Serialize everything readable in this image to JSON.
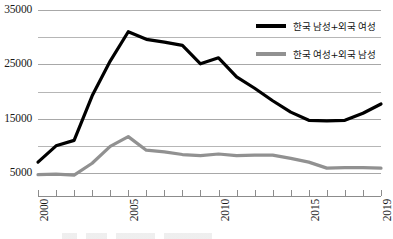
{
  "chart_data": {
    "type": "line",
    "title": "",
    "subtitle": "",
    "xlabel": "",
    "ylabel": "",
    "x": [
      2000,
      2001,
      2002,
      2003,
      2004,
      2005,
      2006,
      2007,
      2008,
      2009,
      2010,
      2011,
      2012,
      2013,
      2014,
      2015,
      2016,
      2017,
      2018,
      2019
    ],
    "categories": [
      "2000",
      "2001",
      "2002",
      "2003",
      "2004",
      "2005",
      "2006",
      "2007",
      "2008",
      "2009",
      "2010",
      "2011",
      "2012",
      "2013",
      "2014",
      "2015",
      "2016",
      "2017",
      "2018",
      "2019"
    ],
    "xlim": [
      2000,
      2019
    ],
    "ylim": [
      0,
      35000
    ],
    "yticks": [
      35000,
      30000,
      25000,
      20000,
      15000,
      10000,
      5000
    ],
    "ytick_labels_shown": [
      "35000",
      "25000",
      "15000",
      "5000"
    ],
    "xtick_labels_shown": [
      "2000",
      "2005",
      "2010",
      "2015",
      "2019"
    ],
    "grid": true,
    "grid_axis": "y",
    "legend_position": "top-right",
    "series": [
      {
        "name": "한국 남성+외국 여성",
        "color": "#000000",
        "values": [
          7000,
          10000,
          11000,
          19200,
          25600,
          31000,
          29600,
          29100,
          28500,
          25100,
          26200,
          22700,
          20600,
          18300,
          16200,
          14700,
          14600,
          14700,
          16000,
          17700
        ]
      },
      {
        "name": "한국 여성+외국 남성",
        "color": "#919191",
        "values": [
          4700,
          4800,
          4600,
          6800,
          9900,
          11700,
          9200,
          8900,
          8400,
          8200,
          8500,
          8200,
          8300,
          8300,
          7700,
          7000,
          5900,
          6000,
          6000,
          5900
        ]
      }
    ]
  },
  "legend": {
    "items": [
      {
        "label": "한국 남성+외국 여성",
        "color": "#000000"
      },
      {
        "label": "한국 여성+외국 남성",
        "color": "#919191"
      }
    ]
  },
  "axes": {
    "y": {
      "labels": [
        "35000",
        "25000",
        "15000",
        "5000"
      ],
      "values": [
        35000,
        25000,
        15000,
        5000
      ]
    },
    "x": {
      "labels": [
        "2000",
        "2005",
        "2010",
        "2015",
        "2019"
      ],
      "values": [
        2000,
        2005,
        2010,
        2015,
        2019
      ]
    }
  }
}
